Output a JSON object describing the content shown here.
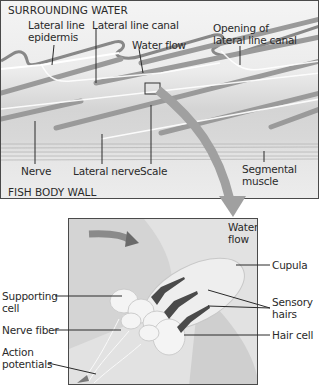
{
  "top_panel": {
    "region_top": "SURROUNDING WATER",
    "region_bottom": "FISH BODY WALL",
    "labels": {
      "lateral_line_epidermis_1": "Lateral line",
      "lateral_line_epidermis_2": "epidermis",
      "lateral_line_canal": "Lateral line canal",
      "water_flow": "Water flow",
      "opening_1": "Opening of",
      "opening_2": "lateral line canal",
      "nerve": "Nerve",
      "lateral_nerve": "Lateral nerve",
      "scale": "Scale",
      "segmental_muscle_1": "Segmental",
      "segmental_muscle_2": "muscle"
    }
  },
  "bottom_panel": {
    "labels": {
      "water_flow_1": "Water",
      "water_flow_2": "flow",
      "cupula": "Cupula",
      "supporting_cell_1": "Supporting",
      "supporting_cell_2": "cell",
      "sensory_hairs_1": "Sensory",
      "sensory_hairs_2": "hairs",
      "nerve_fiber": "Nerve fiber",
      "hair_cell": "Hair cell",
      "action_potentials_1": "Action",
      "action_potentials_2": "potentials"
    }
  },
  "colors": {
    "line": "#2a2a2a",
    "scale_gray": "#9a9a9a",
    "arrow_gray": "#a0a0a0",
    "hair_dark": "#4a4a4a"
  }
}
